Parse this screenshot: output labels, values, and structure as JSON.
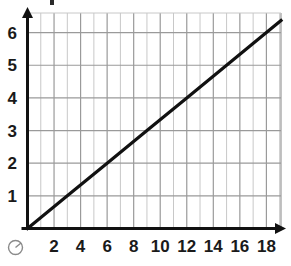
{
  "chart_data": {
    "type": "line",
    "title": "",
    "xlabel": "",
    "ylabel": "",
    "xlim": [
      0,
      19.1
    ],
    "ylim": [
      0,
      6.6
    ],
    "grid": true,
    "legend": null,
    "x_ticks": [
      2,
      4,
      6,
      8,
      10,
      12,
      14,
      16,
      18
    ],
    "y_ticks": [
      1,
      2,
      3,
      4,
      5,
      6
    ],
    "x_minor_step": 1,
    "y_minor_step": 1,
    "origin_label": "O",
    "series": [
      {
        "name": "line",
        "color": "#111111",
        "points": [
          {
            "x": 0,
            "y": 0
          },
          {
            "x": 3,
            "y": 1
          },
          {
            "x": 6,
            "y": 2
          },
          {
            "x": 9,
            "y": 3
          },
          {
            "x": 12,
            "y": 4
          },
          {
            "x": 15,
            "y": 5
          },
          {
            "x": 18,
            "y": 6
          },
          {
            "x": 19.1,
            "y": 6.37
          }
        ],
        "slope": 0.3333,
        "intercept": 0
      }
    ]
  },
  "axes": {
    "x_tick_labels": [
      "2",
      "4",
      "6",
      "8",
      "10",
      "12",
      "14",
      "16",
      "18"
    ],
    "y_tick_labels": [
      "1",
      "2",
      "3",
      "4",
      "5",
      "6"
    ],
    "origin_label": "O"
  },
  "colors": {
    "axis": "#111111",
    "line": "#111111",
    "grid_major": "#9a9a9a",
    "grid_minor": "#c8c8c8",
    "label": "#1a1a1a",
    "origin": "#8a8a8a",
    "background": "#ffffff"
  }
}
